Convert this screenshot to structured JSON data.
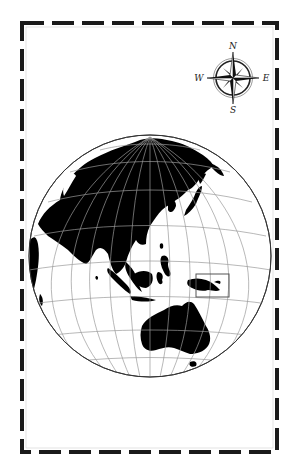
{
  "map": {
    "type": "orthographic-locator-map",
    "focus_region": "Papua New Guinea",
    "highlight_box": {
      "x": 196,
      "y": 274,
      "w": 33,
      "h": 23,
      "color": "#555555"
    },
    "globe": {
      "cx": 150,
      "cy": 256,
      "r": 121,
      "land_color": "#000000",
      "ocean_color": "#ffffff",
      "graticule_color": "#9a9a9a"
    },
    "frame": {
      "x": 21,
      "y": 22,
      "w": 257,
      "h": 431,
      "dash_color": "#1a1a1a"
    }
  },
  "compass": {
    "north": "N",
    "east": "E",
    "south": "S",
    "west": "W"
  }
}
